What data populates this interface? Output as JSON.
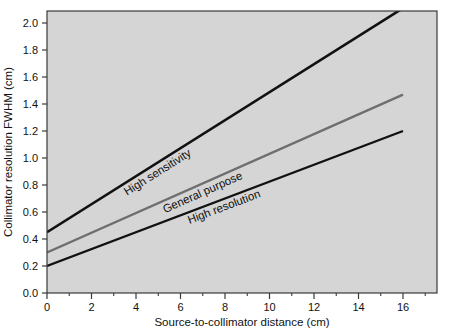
{
  "chart_data": {
    "type": "line",
    "title": "",
    "xlabel": "Source-to-collimator distance (cm)",
    "ylabel": "Collimator resolution FWHM (cm)",
    "xlim": [
      0,
      17.5
    ],
    "ylim": [
      0.0,
      2.1
    ],
    "grid": false,
    "legend_position": "inline-labels",
    "plot_background_color": "#d5d5d5",
    "figure_background_color": "#ffffff",
    "x_major_ticks": [
      0,
      2,
      4,
      6,
      8,
      10,
      12,
      14,
      16
    ],
    "x_minor_ticks": [
      1,
      3,
      5,
      7,
      9,
      11,
      13,
      15,
      17
    ],
    "x_tick_labels": [
      "0",
      "2",
      "4",
      "6",
      "8",
      "10",
      "12",
      "14",
      "16"
    ],
    "y_major_ticks": [
      0.0,
      0.2,
      0.4,
      0.6,
      0.8,
      1.0,
      1.2,
      1.4,
      1.6,
      1.8,
      2.0
    ],
    "y_tick_labels": [
      "0.0",
      "0.2",
      "0.4",
      "0.6",
      "0.8",
      "1.0",
      "1.2",
      "1.4",
      "1.6",
      "1.8",
      "2.0"
    ],
    "series": [
      {
        "name": "High sensitivity",
        "color": "#111111",
        "line_width": 2.6,
        "x": [
          0,
          16
        ],
        "y": [
          0.45,
          2.11
        ],
        "label_text": "High sensitivity"
      },
      {
        "name": "General purpose",
        "color": "#6e6e6e",
        "line_width": 2.4,
        "x": [
          0,
          16
        ],
        "y": [
          0.3,
          1.47
        ],
        "label_text": "General purpose"
      },
      {
        "name": "High resolution",
        "color": "#111111",
        "line_width": 2.4,
        "x": [
          0,
          16
        ],
        "y": [
          0.2,
          1.2
        ],
        "label_text": "High resolution"
      }
    ]
  }
}
